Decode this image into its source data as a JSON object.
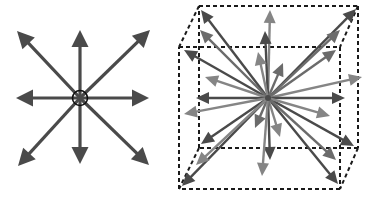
{
  "figure": {
    "panels": [
      {
        "id": "planar-star",
        "description": "8 arrows radiating from a central circled point in a plane",
        "arrow_directions": [
          "up-left",
          "up",
          "up-right",
          "left",
          "right",
          "down-left",
          "down",
          "down-right"
        ],
        "center_marker": "circle-with-cross"
      },
      {
        "id": "cubic-star",
        "description": "Arrows radiating from the center of a dashed cube toward corners, edges and faces",
        "container": "dashed-cube",
        "arrow_count": 26
      }
    ],
    "colors": {
      "arrow_dark": "#4a4a4a",
      "arrow_mid": "#6b6b6b",
      "arrow_light": "#858585",
      "cube_line": "#1a1a1a",
      "background": "#ffffff"
    }
  }
}
